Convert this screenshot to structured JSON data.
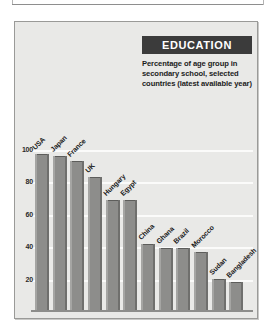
{
  "chart_data": {
    "type": "bar",
    "title": "EDUCATION",
    "subtitle": "Percentage of age group in secondary school, selected countries (latest available year)",
    "xlabel": "",
    "ylabel": "",
    "ylim": [
      0,
      108
    ],
    "yticks": [
      20,
      40,
      60,
      80,
      100
    ],
    "grid": true,
    "legend": "none",
    "categories": [
      "USA",
      "Japan",
      "France",
      "UK",
      "Hungary",
      "Egypt",
      "China",
      "Ghana",
      "Brazil",
      "Morocco",
      "Sudan",
      "Bangladesh"
    ],
    "values": [
      96,
      95,
      92,
      82,
      68,
      68,
      41,
      38,
      38,
      36,
      19,
      17
    ]
  },
  "panel": {
    "background_color": "#e9e9e7",
    "bar_color": "#8d8d8b",
    "title_band_color": "#3b3b3b",
    "gridline_color": "#fbfbfa",
    "axis_color": "#8d8d8b"
  }
}
